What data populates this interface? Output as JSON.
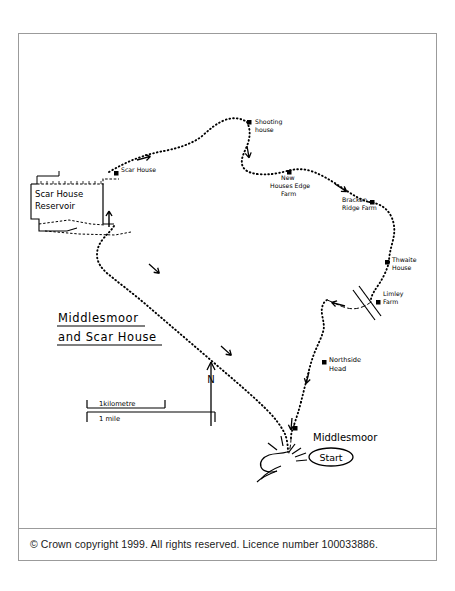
{
  "document": {
    "title": "Middlesmoor and Scar House",
    "copyright": "© Crown copyright 1999. All rights reserved. Licence number 100033886."
  },
  "map": {
    "title_line1": "Middlesmoor",
    "title_line2": "and Scar House",
    "north_arrow_label": "N",
    "start_marker": {
      "place_label": "Middlesmoor",
      "badge_label": "Start"
    },
    "scale_bars": [
      {
        "label": "1kilometre",
        "length_px": 78
      },
      {
        "label": "1 mile",
        "length_px": 128
      }
    ],
    "labels": [
      {
        "id": "scar-house-reservoir",
        "text_line1": "Scar House",
        "text_line2": "Reservoir",
        "x": 33,
        "y": 160,
        "type": "water"
      },
      {
        "id": "scar-house",
        "text_line1": "Scar House",
        "text_line2": "",
        "x": 107,
        "y": 142,
        "type": "building"
      },
      {
        "id": "shooting-house",
        "text_line1": "Shooting",
        "text_line2": "house",
        "x": 235,
        "y": 92,
        "type": "building"
      },
      {
        "id": "new-houses-edge-farm",
        "text_line1": "New",
        "text_line2": "Houses Edge",
        "text_line3": "Farm",
        "x": 265,
        "y": 140,
        "type": "building"
      },
      {
        "id": "bracken-ridge-farm",
        "text_line1": "Bracken",
        "text_line2": "Ridge Farm",
        "x": 336,
        "y": 170,
        "type": "building"
      },
      {
        "id": "thwaite-house",
        "text_line1": "Thwaite",
        "text_line2": "House",
        "x": 376,
        "y": 225,
        "type": "building"
      },
      {
        "id": "limley-farm",
        "text_line1": "Limley",
        "text_line2": "Farm",
        "x": 370,
        "y": 258,
        "type": "building"
      },
      {
        "id": "northside-head",
        "text_line1": "Northside",
        "text_line2": "Head",
        "x": 310,
        "y": 325,
        "type": "place"
      }
    ],
    "colors": {
      "ink": "#000000",
      "frame": "#9b9b9b",
      "paper": "#ffffff",
      "footer_text": "#1a1a1a"
    }
  }
}
